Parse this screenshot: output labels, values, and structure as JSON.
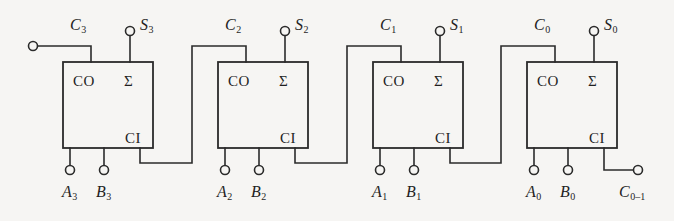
{
  "diagram": {
    "type": "logic-circuit",
    "background_color": "#f6f5f3",
    "line_color": "#2b2b2b",
    "width": 674,
    "height": 221,
    "port_labels": {
      "carry_out": "CO",
      "carry_in": "CI",
      "sum": "Σ"
    },
    "stages": [
      {
        "index": 0,
        "bit": "3",
        "box": {
          "x": 63,
          "y": 62,
          "w": 90,
          "h": 86
        },
        "carry_out_label": {
          "text": "C",
          "sub": "3"
        },
        "sum_label": {
          "text": "S",
          "sub": "3"
        },
        "input_a_label": {
          "text": "A",
          "sub": "3"
        },
        "input_b_label": {
          "text": "B",
          "sub": "3"
        },
        "carry_out_terminal": {
          "x": 33,
          "y": 46
        },
        "sum_terminal": {
          "x": 130,
          "y": 31
        },
        "input_a_terminal": {
          "x": 70,
          "y": 170
        },
        "input_b_terminal": {
          "x": 104,
          "y": 170
        },
        "carry_out_is_open_terminal": true,
        "carry_in_is_open_terminal": false
      },
      {
        "index": 1,
        "bit": "2",
        "box": {
          "x": 218,
          "y": 62,
          "w": 90,
          "h": 86
        },
        "carry_out_label": {
          "text": "C",
          "sub": "2"
        },
        "sum_label": {
          "text": "S",
          "sub": "2"
        },
        "input_a_label": {
          "text": "A",
          "sub": "2"
        },
        "input_b_label": {
          "text": "B",
          "sub": "2"
        },
        "sum_terminal": {
          "x": 285,
          "y": 31
        },
        "input_a_terminal": {
          "x": 225,
          "y": 170
        },
        "input_b_terminal": {
          "x": 259,
          "y": 170
        },
        "carry_out_is_open_terminal": false,
        "carry_in_is_open_terminal": false
      },
      {
        "index": 2,
        "bit": "1",
        "box": {
          "x": 373,
          "y": 62,
          "w": 90,
          "h": 86
        },
        "carry_out_label": {
          "text": "C",
          "sub": "1"
        },
        "sum_label": {
          "text": "S",
          "sub": "1"
        },
        "input_a_label": {
          "text": "A",
          "sub": "1"
        },
        "input_b_label": {
          "text": "B",
          "sub": "1"
        },
        "sum_terminal": {
          "x": 440,
          "y": 31
        },
        "input_a_terminal": {
          "x": 380,
          "y": 170
        },
        "input_b_terminal": {
          "x": 414,
          "y": 170
        },
        "carry_out_is_open_terminal": false,
        "carry_in_is_open_terminal": false
      },
      {
        "index": 3,
        "bit": "0",
        "box": {
          "x": 527,
          "y": 62,
          "w": 90,
          "h": 86
        },
        "carry_out_label": {
          "text": "C",
          "sub": "0"
        },
        "sum_label": {
          "text": "S",
          "sub": "0"
        },
        "input_a_label": {
          "text": "A",
          "sub": "0"
        },
        "input_b_label": {
          "text": "B",
          "sub": "0"
        },
        "sum_terminal": {
          "x": 594,
          "y": 31
        },
        "input_a_terminal": {
          "x": 534,
          "y": 170
        },
        "input_b_terminal": {
          "x": 568,
          "y": 170
        },
        "carry_out_is_open_terminal": false,
        "carry_in_is_open_terminal": true,
        "carry_in_terminal": {
          "x": 638,
          "y": 170
        },
        "carry_in_label": {
          "text": "C",
          "sub": "0–1"
        }
      }
    ],
    "labels": {
      "c3": "C",
      "c3_sub": "3",
      "s3": "S",
      "s3_sub": "3",
      "a3": "A",
      "a3_sub": "3",
      "b3": "B",
      "b3_sub": "3",
      "c2": "C",
      "c2_sub": "2",
      "s2": "S",
      "s2_sub": "2",
      "a2": "A",
      "a2_sub": "2",
      "b2": "B",
      "b2_sub": "2",
      "c1": "C",
      "c1_sub": "1",
      "s1": "S",
      "s1_sub": "1",
      "a1": "A",
      "a1_sub": "1",
      "b1": "B",
      "b1_sub": "1",
      "c0": "C",
      "c0_sub": "0",
      "s0": "S",
      "s0_sub": "0",
      "a0": "A",
      "a0_sub": "0",
      "b0": "B",
      "b0_sub": "0",
      "cin": "C",
      "cin_sub": "0–1"
    }
  }
}
